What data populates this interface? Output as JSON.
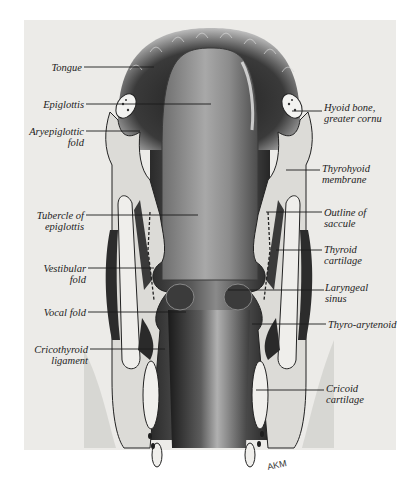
{
  "figure": {
    "signature": "AKM",
    "labels_left": [
      {
        "id": "tongue",
        "lines": [
          "Tongue"
        ]
      },
      {
        "id": "epiglottis",
        "lines": [
          "Epiglottis"
        ]
      },
      {
        "id": "aryepiglottic-fold",
        "lines": [
          "Aryepiglottic",
          "fold"
        ]
      },
      {
        "id": "tubercle-of-epiglottis",
        "lines": [
          "Tubercle of",
          "epiglottis"
        ]
      },
      {
        "id": "vestibular-fold",
        "lines": [
          "Vestibular",
          "fold"
        ]
      },
      {
        "id": "vocal-fold",
        "lines": [
          "Vocal fold"
        ]
      },
      {
        "id": "cricothyroid-ligament",
        "lines": [
          "Cricothyroid",
          "ligament"
        ]
      }
    ],
    "labels_right": [
      {
        "id": "hyoid-bone-greater-cornu",
        "lines": [
          "Hyoid bone,",
          "greater cornu"
        ]
      },
      {
        "id": "thyrohyoid-membrane",
        "lines": [
          "Thyrohyoid",
          "membrane"
        ]
      },
      {
        "id": "outline-of-saccule",
        "lines": [
          "Outline of",
          "saccule"
        ]
      },
      {
        "id": "thyroid-cartilage",
        "lines": [
          "Thyroid",
          "cartilage"
        ]
      },
      {
        "id": "laryngeal-sinus",
        "lines": [
          "Laryngeal",
          "sinus"
        ]
      },
      {
        "id": "thyro-arytenoid",
        "lines": [
          "Thyro-arytenoid"
        ]
      },
      {
        "id": "cricoid-cartilage",
        "lines": [
          "Cricoid",
          "cartilage"
        ]
      }
    ]
  }
}
